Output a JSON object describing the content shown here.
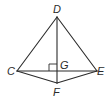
{
  "diagram": {
    "type": "geometry-figure",
    "points": [
      {
        "name": "D",
        "label": "D",
        "x": 57,
        "y": 17
      },
      {
        "name": "C",
        "label": "C",
        "x": 17,
        "y": 71
      },
      {
        "name": "E",
        "label": "E",
        "x": 97,
        "y": 71
      },
      {
        "name": "G",
        "label": "G",
        "x": 57,
        "y": 71
      },
      {
        "name": "F",
        "label": "F",
        "x": 57,
        "y": 83
      }
    ],
    "segments": [
      "DC",
      "DE",
      "DF",
      "CE",
      "CF",
      "EF"
    ],
    "right_angle_marks": [
      {
        "at": "G",
        "between": [
          "GD",
          "GC"
        ]
      }
    ],
    "colors": {
      "stroke": "#2b2b2b",
      "background": "#ffffff"
    }
  }
}
